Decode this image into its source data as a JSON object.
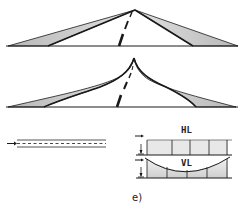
{
  "figure": {
    "caption": "e)",
    "panels": [
      {
        "id": "road-straight-horizon",
        "description": "Perspective road with straight edges converging to a point"
      },
      {
        "id": "road-curved-horizon",
        "description": "Perspective road with edges curving upward near vanishing point"
      },
      {
        "id": "side-view-flat",
        "description": "Side view of flat road with direction arrow"
      },
      {
        "id": "profile-hl",
        "label": "HL"
      },
      {
        "id": "profile-vl",
        "label": "VL"
      }
    ]
  },
  "labels": {
    "hl": "HL",
    "vl": "VL",
    "caption": "e)"
  },
  "colors": {
    "ink": "#1a1a1a",
    "shade": "#c8c8c8",
    "background": "#ffffff"
  }
}
